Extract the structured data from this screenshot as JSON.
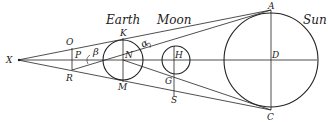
{
  "diagram": {
    "type": "geometry",
    "colors": {
      "stroke": "#222222",
      "background": "#ffffff"
    },
    "bodies": {
      "earth": {
        "label": "Earth",
        "center_label": "N",
        "top_label": "K",
        "bottom_label": "M"
      },
      "moon": {
        "label": "Moon",
        "center_label": "H",
        "lower_label": "G"
      },
      "sun": {
        "label": "Sun",
        "center_label": "D",
        "top_label": "A",
        "bottom_label": "C"
      }
    },
    "points": {
      "x": "X",
      "o": "O",
      "p": "P",
      "r": "R",
      "s": "S"
    },
    "angles": {
      "beta": "β",
      "alpha": "α"
    }
  }
}
